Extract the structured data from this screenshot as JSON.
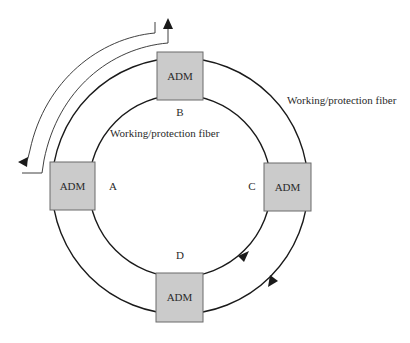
{
  "diagram": {
    "type": "bidirectional line-switched ring",
    "ring": {
      "center": [
        180,
        186
      ],
      "outer_radius": 128,
      "inner_radius": 91
    },
    "colors": {
      "box_fill": "#cbcbcb",
      "box_border": "#6b6b6b",
      "line": "#1a1a1a",
      "text": "#2a2a2a"
    },
    "nodes": [
      {
        "id": "B",
        "label": "ADM",
        "site_label": "B",
        "box": [
          157,
          52,
          46,
          48
        ],
        "site_pos": [
          180,
          116
        ]
      },
      {
        "id": "A",
        "label": "ADM",
        "site_label": "A",
        "box": [
          50,
          162,
          45,
          48
        ],
        "site_pos": [
          113,
          190
        ]
      },
      {
        "id": "C",
        "label": "ADM",
        "site_label": "C",
        "box": [
          264,
          163,
          47,
          48
        ],
        "site_pos": [
          252,
          190
        ]
      },
      {
        "id": "D",
        "label": "ADM",
        "site_label": "D",
        "box": [
          156,
          273,
          47,
          49
        ],
        "site_pos": [
          180,
          259
        ]
      }
    ],
    "fiber_labels": [
      {
        "text": "Working/protection fiber",
        "pos": [
          287,
          104
        ],
        "anchor": "start"
      },
      {
        "text": "Working/protection fiber",
        "pos": [
          110,
          137
        ],
        "anchor": "start"
      }
    ],
    "traffic_arrows": {
      "upper_left_route_description": "Loop-back path around failed segment between A and B",
      "lower_right_description": "Inner fiber counterclockwise (D to C), outer fiber clockwise (C to D)"
    }
  }
}
